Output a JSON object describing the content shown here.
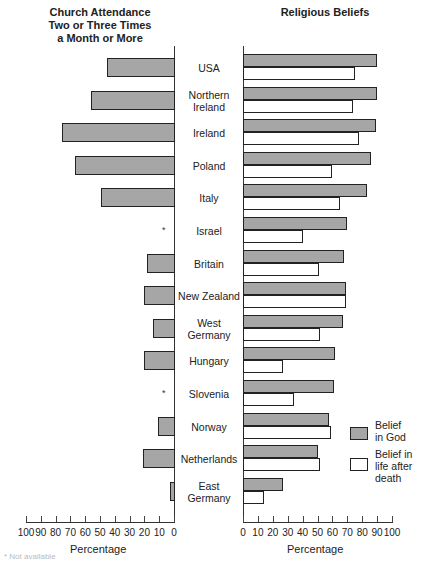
{
  "chart_data": [
    {
      "type": "bar",
      "orientation": "horizontal",
      "title": "Church Attendance Two or Three Times a Month or More",
      "title_lines": [
        "Church Attendance",
        "Two or Three Times",
        "a Month or More"
      ],
      "xlabel": "Percentage",
      "xlim": [
        100,
        0
      ],
      "x_ticks": [
        100,
        90,
        80,
        70,
        60,
        50,
        40,
        30,
        20,
        10,
        0
      ],
      "categories": [
        "USA",
        "Northern Ireland",
        "Ireland",
        "Poland",
        "Italy",
        "Israel",
        "Britain",
        "New Zealand",
        "West Germany",
        "Hungary",
        "Slovenia",
        "Norway",
        "Netherlands",
        "East Germany"
      ],
      "values": [
        45,
        56,
        76,
        67,
        49,
        null,
        18,
        20,
        14,
        20,
        null,
        11,
        21,
        3
      ],
      "annotations": [
        "* shown for Israel and Slovenia (not available)"
      ]
    },
    {
      "type": "bar",
      "orientation": "horizontal",
      "title": "Religious Beliefs",
      "xlabel": "Percentage",
      "xlim": [
        0,
        100
      ],
      "x_ticks": [
        0,
        10,
        20,
        30,
        40,
        50,
        60,
        70,
        80,
        90,
        100
      ],
      "categories": [
        "USA",
        "Northern Ireland",
        "Ireland",
        "Poland",
        "Italy",
        "Israel",
        "Britain",
        "New Zealand",
        "West Germany",
        "Hungary",
        "Slovenia",
        "Norway",
        "Netherlands",
        "East Germany"
      ],
      "series": [
        {
          "name": "Belief in God",
          "color": "#a6a6a6",
          "values": [
            90,
            90,
            89,
            86,
            83,
            70,
            68,
            69,
            67,
            62,
            61,
            58,
            50,
            27
          ]
        },
        {
          "name": "Belief in life after death",
          "color": "#ffffff",
          "values": [
            75,
            74,
            78,
            60,
            65,
            40,
            51,
            69,
            52,
            27,
            34,
            59,
            52,
            14
          ]
        }
      ],
      "legend_position": "lower right"
    }
  ],
  "titles": {
    "left": [
      "Church Attendance",
      "Two or Three Times",
      "a Month or More"
    ],
    "right": "Religious Beliefs"
  },
  "countries": [
    {
      "lines": [
        "USA"
      ]
    },
    {
      "lines": [
        "Northern",
        "Ireland"
      ]
    },
    {
      "lines": [
        "Ireland"
      ]
    },
    {
      "lines": [
        "Poland"
      ]
    },
    {
      "lines": [
        "Italy"
      ]
    },
    {
      "lines": [
        "Israel"
      ]
    },
    {
      "lines": [
        "Britain"
      ]
    },
    {
      "lines": [
        "New Zealand"
      ]
    },
    {
      "lines": [
        "West",
        "Germany"
      ]
    },
    {
      "lines": [
        "Hungary"
      ]
    },
    {
      "lines": [
        "Slovenia"
      ]
    },
    {
      "lines": [
        "Norway"
      ]
    },
    {
      "lines": [
        "Netherlands"
      ]
    },
    {
      "lines": [
        "East",
        "Germany"
      ]
    }
  ],
  "missing_marker": "*",
  "axes": {
    "left_xlabel": "Percentage",
    "right_xlabel": "Percentage",
    "left_ticks": [
      "100",
      "90",
      "80",
      "70",
      "60",
      "50",
      "40",
      "30",
      "20",
      "10",
      "0"
    ],
    "right_ticks": [
      "0",
      "10",
      "20",
      "30",
      "40",
      "50",
      "60",
      "70",
      "80",
      "90",
      "100"
    ]
  },
  "legend": {
    "god": [
      "Belief",
      "in God"
    ],
    "after": [
      "Belief in",
      "life after",
      "death"
    ]
  },
  "footnote": "* Not available"
}
